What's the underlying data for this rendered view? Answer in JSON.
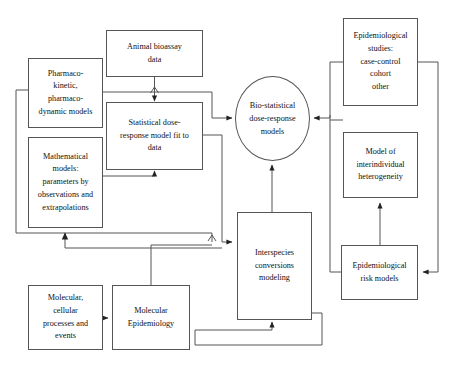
{
  "diagram": {
    "background_color": "#ffffff",
    "line_color": "#555555",
    "text_color": "#111111",
    "nodes": [
      {
        "id": "animal_bioassay",
        "name": "animal-bioassay-data",
        "shape": "rect",
        "lines": [
          "Animal bioassay",
          "data"
        ],
        "x": 106,
        "y": 30,
        "w": 97,
        "h": 47
      },
      {
        "id": "pk_pd_models",
        "name": "pharmacokinetic-pharmacodynamic-models",
        "shape": "rect",
        "lines": [
          "Pharmaco-",
          "kinetic,",
          "pharmaco-",
          "dynamic models"
        ],
        "x": 28,
        "y": 58,
        "w": 75,
        "h": 70
      },
      {
        "id": "statistical_dose_response",
        "name": "statistical-dose-response-model-fit-to-data",
        "shape": "rect",
        "lines": [
          "Statistical dose-",
          "response model fit to",
          "data"
        ],
        "x": 106,
        "y": 102,
        "w": 97,
        "h": 68
      },
      {
        "id": "mathematical_models",
        "name": "mathematical-models-parameters",
        "shape": "rect",
        "lines": [
          "Mathematical",
          "models:",
          "parameters by",
          "observations and",
          "extrapolations"
        ],
        "x": 28,
        "y": 137,
        "w": 75,
        "h": 91
      },
      {
        "id": "molecular_cellular",
        "name": "molecular-cellular-processes-and-events",
        "shape": "rect",
        "lines": [
          "Molecular,",
          "cellular",
          "processes and",
          "events"
        ],
        "x": 28,
        "y": 285,
        "w": 75,
        "h": 65
      },
      {
        "id": "molecular_epidemiology",
        "name": "molecular-epidemiology",
        "shape": "rect",
        "lines": [
          "Molecular",
          "Epidemiology"
        ],
        "x": 112,
        "y": 285,
        "w": 78,
        "h": 65
      },
      {
        "id": "biostatistical_models",
        "name": "bio-statistical-dose-response-models",
        "shape": "ellipse",
        "lines": [
          "Bio-statistical",
          "dose-response",
          "models"
        ],
        "x": 235,
        "y": 76,
        "w": 75,
        "h": 85
      },
      {
        "id": "interspecies",
        "name": "interspecies-conversions-modeling",
        "shape": "rect",
        "lines": [
          "Interspecies",
          "conversions",
          "modeling"
        ],
        "x": 237,
        "y": 212,
        "w": 75,
        "h": 108
      },
      {
        "id": "epi_studies",
        "name": "epidemiological-studies",
        "shape": "rect",
        "lines": [
          "Epidemiological",
          "studies:",
          "case-control",
          "cohort",
          "other"
        ],
        "x": 343,
        "y": 18,
        "w": 75,
        "h": 88
      },
      {
        "id": "interindividual_heterogeneity",
        "name": "model-of-interindividual-heterogeneity",
        "shape": "rect",
        "lines": [
          "Model of",
          "interindividual",
          "heterogeneity"
        ],
        "x": 343,
        "y": 132,
        "w": 75,
        "h": 66
      },
      {
        "id": "epi_risk_models",
        "name": "epidemiological-risk-models",
        "shape": "rect",
        "lines": [
          "Epidemiological",
          "risk models"
        ],
        "x": 341,
        "y": 245,
        "w": 77,
        "h": 55
      }
    ],
    "edges": [
      {
        "name": "edge-animal-bioassay-to-statistical",
        "from": "animal_bioassay",
        "to": "statistical_dose_response"
      },
      {
        "name": "edge-pkpd-to-statistical",
        "from": "pk_pd_models",
        "to": "statistical_dose_response"
      },
      {
        "name": "edge-mathematical-to-statistical",
        "from": "mathematical_models",
        "to": "statistical_dose_response"
      },
      {
        "name": "edge-statistical-to-biostatistical",
        "from": "statistical_dose_response",
        "to": "biostatistical_models"
      },
      {
        "name": "edge-pkpd-to-interspecies",
        "from": "pk_pd_models",
        "to": "interspecies"
      },
      {
        "name": "edge-molecular-to-molecular-epidemiology",
        "from": "molecular_cellular",
        "to": "molecular_epidemiology"
      },
      {
        "name": "edge-molecular-epidemiology-to-interspecies",
        "from": "molecular_epidemiology",
        "to": "interspecies"
      },
      {
        "name": "edge-molecular-epidemiology-to-mathematical",
        "from": "molecular_epidemiology",
        "to": "mathematical_models"
      },
      {
        "name": "edge-interspecies-to-biostatistical",
        "from": "interspecies",
        "to": "biostatistical_models"
      },
      {
        "name": "edge-interspecies-self-loop",
        "from": "interspecies",
        "to": "interspecies"
      },
      {
        "name": "edge-epi-studies-to-biostatistical",
        "from": "epi_studies",
        "to": "biostatistical_models"
      },
      {
        "name": "edge-heterogeneity-to-biostatistical",
        "from": "interindividual_heterogeneity",
        "to": "biostatistical_models"
      },
      {
        "name": "edge-epi-risk-to-heterogeneity",
        "from": "epi_risk_models",
        "to": "interindividual_heterogeneity"
      },
      {
        "name": "edge-epi-studies-to-epi-risk",
        "from": "epi_studies",
        "to": "epi_risk_models"
      }
    ]
  }
}
